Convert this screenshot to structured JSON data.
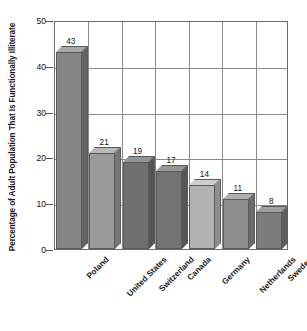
{
  "chart_data": {
    "type": "bar",
    "title": "",
    "subtitle": "",
    "xlabel": "",
    "ylabel": "Percentage of Adult Population That Is Functionally Illiterate",
    "categories": [
      "Poland",
      "United States",
      "Switzerland",
      "Canada",
      "Germany",
      "Netherlands",
      "Sweden"
    ],
    "values": [
      43,
      21,
      19,
      17,
      14,
      11,
      8
    ],
    "data_labels": [
      "43",
      "21",
      "19",
      "17",
      "14",
      "11",
      "8"
    ],
    "ylim": [
      0,
      50
    ],
    "yticks": [
      0,
      10,
      20,
      30,
      40,
      50
    ],
    "ytick_labels": [
      "0",
      "10",
      "20",
      "30",
      "40",
      "50"
    ],
    "grid": "horizontal-and-vertical",
    "legend": "none",
    "legend_position": "none",
    "style": "3d-bars",
    "bar_colors": [
      "#858585",
      "#9a9a9a",
      "#6f6f6f",
      "#737373",
      "#b2b2b2",
      "#8d8d8d",
      "#7c7c7c"
    ],
    "bar_top_colors": [
      "#a8a8a8",
      "#b9b9b9",
      "#949494",
      "#979797",
      "#cecece",
      "#b0b0b0",
      "#a0a0a0"
    ],
    "bar_side_colors": [
      "#636363",
      "#767676",
      "#545454",
      "#575757",
      "#8d8d8d",
      "#6b6b6b",
      "#5d5d5d"
    ],
    "axis_color": "#6b6b6b",
    "grid_color": "#8a8a8a",
    "text_color": "#1a1a1a",
    "background": "#ffffff"
  }
}
